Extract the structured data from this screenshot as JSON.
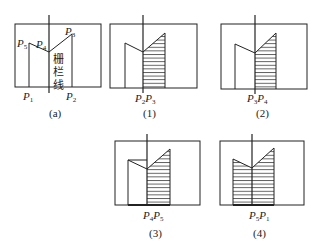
{
  "panels": [
    {
      "id": "a",
      "caption": "(a)",
      "points": [
        {
          "name": "P",
          "sub": "5"
        },
        {
          "name": "P",
          "sub": "4"
        },
        {
          "name": "P",
          "sub": "3"
        },
        {
          "name": "P",
          "sub": "1"
        },
        {
          "name": "P",
          "sub": "2"
        }
      ],
      "fence_label": [
        "栅",
        "栏",
        "线"
      ]
    },
    {
      "id": "1",
      "caption": "(1)",
      "bottom_label": {
        "a": "P",
        "a_sub": "2",
        "b": "P",
        "b_sub": "3"
      }
    },
    {
      "id": "2",
      "caption": "(2)",
      "bottom_label": {
        "a": "P",
        "a_sub": "3",
        "b": "P",
        "b_sub": "4"
      }
    },
    {
      "id": "3",
      "caption": "(3)",
      "bottom_label": {
        "a": "P",
        "a_sub": "4",
        "b": "P",
        "b_sub": "5"
      }
    },
    {
      "id": "4",
      "caption": "(4)",
      "bottom_label": {
        "a": "P",
        "a_sub": "5",
        "b": "P",
        "b_sub": "1"
      }
    }
  ],
  "colors": {
    "stroke": "#222222",
    "hatch": "#333333",
    "background": "#ffffff"
  }
}
